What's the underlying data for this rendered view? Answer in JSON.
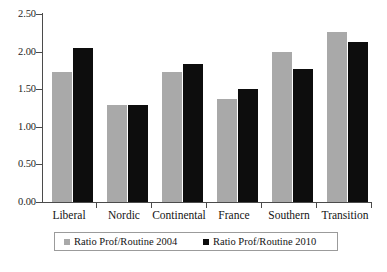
{
  "chart_data": {
    "type": "bar",
    "title": "",
    "xlabel": "",
    "ylabel": "",
    "ylim": [
      0,
      2.5
    ],
    "ytick_labels": [
      "0.00",
      "0.50",
      "1.00",
      "1.50",
      "2.00",
      "2.50"
    ],
    "ytick_values": [
      0,
      0.5,
      1.0,
      1.5,
      2.0,
      2.5
    ],
    "grid": false,
    "legend_position": "bottom",
    "categories": [
      "Liberal",
      "Nordic",
      "Continental",
      "France",
      "Southern",
      "Transition"
    ],
    "series": [
      {
        "name": "Ratio Prof/Routine 2004",
        "color": "#a9a9a9",
        "values": [
          1.73,
          1.29,
          1.73,
          1.37,
          2.0,
          2.26
        ]
      },
      {
        "name": "Ratio Prof/Routine 2010",
        "color": "#0d0d0d",
        "values": [
          2.05,
          1.29,
          1.84,
          1.5,
          1.77,
          2.13
        ]
      }
    ]
  },
  "legend": {
    "items": [
      {
        "label": "Ratio Prof/Routine 2004",
        "swatch_icon": "square-swatch-gray"
      },
      {
        "label": "Ratio Prof/Routine 2010",
        "swatch_icon": "square-swatch-black"
      }
    ]
  },
  "caption": {
    "partial_text": ""
  }
}
